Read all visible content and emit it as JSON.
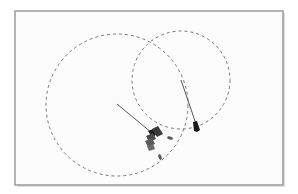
{
  "diagram": {
    "type": "vessel-encounter-sketch",
    "frame": {
      "x": 15,
      "y": 11,
      "width": 268,
      "height": 174,
      "stroke": "#9a9a9a",
      "fill": "#fcfcfc"
    },
    "circles": [
      {
        "id": "left-range-circle",
        "cx": 117,
        "cy": 105,
        "r": 71,
        "stroke": "#777777",
        "dash": "3,3"
      },
      {
        "id": "right-range-circle",
        "cx": 181,
        "cy": 80,
        "r": 49,
        "stroke": "#777777",
        "dash": "3,3"
      }
    ],
    "heading_lines": [
      {
        "id": "left-vessel-heading",
        "x1": 117,
        "y1": 104,
        "x2": 152,
        "y2": 133,
        "stroke": "#555555"
      },
      {
        "id": "right-vessel-heading",
        "x1": 181,
        "y1": 80,
        "x2": 196,
        "y2": 124,
        "stroke": "#555555"
      }
    ],
    "vessels": [
      {
        "id": "vessel-cluster-left",
        "color": "#2a2a2a",
        "accent": "#555555"
      },
      {
        "id": "vessel-right",
        "color": "#1a1a1a"
      }
    ],
    "markers": [
      {
        "id": "small-marker-1",
        "x": 170,
        "y": 138
      },
      {
        "id": "small-marker-2",
        "x": 160,
        "y": 157
      }
    ]
  }
}
